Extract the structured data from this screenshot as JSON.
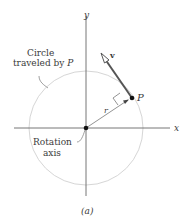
{
  "figure": {
    "caption": "(a)",
    "axes": {
      "x_label": "x",
      "y_label": "y"
    },
    "labels": {
      "circle_line1": "Circle",
      "circle_line2": "traveled by ",
      "circle_point": "P",
      "rotation_line1": "Rotation",
      "rotation_line2": "axis",
      "point": "P",
      "velocity": "v",
      "radius": "r"
    },
    "colors": {
      "axis": "#555555",
      "circle": "#d0d0d0",
      "vector": "#555555",
      "text": "#3a3a3a"
    }
  }
}
